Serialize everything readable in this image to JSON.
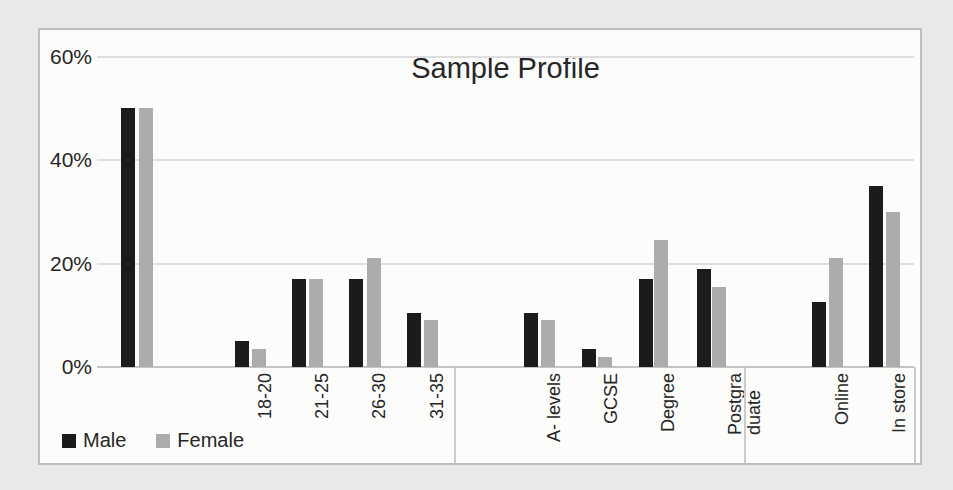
{
  "chart_data": {
    "type": "bar",
    "title": "Sample Profile",
    "xlabel": "",
    "ylabel": "",
    "ylim": [
      0,
      60
    ],
    "yticks": [
      0,
      20,
      40,
      60
    ],
    "ytick_suffix": "%",
    "grid": true,
    "legend_position": "bottom-left",
    "categories": [
      "",
      "18-20",
      "21-25",
      "26-30",
      "31-35",
      "A- levels",
      "GCSE",
      "Degree",
      "Postgra\nduate",
      "Online",
      "In store"
    ],
    "category_groups": [
      "gender",
      "age",
      "age",
      "age",
      "age",
      "education",
      "education",
      "education",
      "education",
      "channel",
      "channel"
    ],
    "series": [
      {
        "name": "Male",
        "color": "#1b1b1b",
        "values": [
          50,
          5,
          17,
          17,
          10.5,
          10.5,
          3.5,
          17,
          19,
          12.5,
          35
        ]
      },
      {
        "name": "Female",
        "color": "#acacac",
        "values": [
          50,
          3.5,
          17,
          21,
          9,
          9,
          2,
          24.5,
          15.5,
          21,
          30
        ]
      }
    ]
  },
  "colors": {
    "page_background": "#e9e9e7",
    "chart_background": "#fcfcfb",
    "chart_border": "#bdbdbd",
    "gridline": "#dedede",
    "axis_line": "#c4c4c4",
    "text": "#262626"
  }
}
